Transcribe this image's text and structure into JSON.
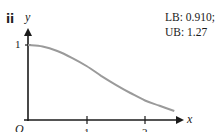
{
  "part_label": "ii",
  "bounds": {
    "lb": "LB: 0.910;",
    "ub": "UB: 1.27"
  },
  "axes": {
    "x_label": "x",
    "y_label": "y",
    "origin_label": "O",
    "y_tick_1": "1",
    "x_tick_1": "1",
    "x_tick_2": "2"
  },
  "colors": {
    "axis": "#1a1a1a",
    "curve": "#9a9a9a"
  },
  "chart_data": {
    "type": "line",
    "title": "",
    "xlabel": "x",
    "ylabel": "y",
    "x_ticks": [
      1,
      2
    ],
    "y_ticks": [
      1
    ],
    "xlim": [
      0,
      2.6
    ],
    "ylim": [
      0,
      1.2
    ],
    "grid": false,
    "legend": null,
    "annotations": [
      "ii",
      "LB: 0.910;",
      "UB: 1.27"
    ],
    "series": [
      {
        "name": "decreasing curve",
        "x": [
          0,
          0.25,
          0.5,
          0.75,
          1.0,
          1.25,
          1.5,
          1.75,
          2.0,
          2.25,
          2.5
        ],
        "y": [
          1.0,
          0.98,
          0.92,
          0.83,
          0.72,
          0.59,
          0.47,
          0.36,
          0.26,
          0.19,
          0.12
        ]
      }
    ]
  }
}
